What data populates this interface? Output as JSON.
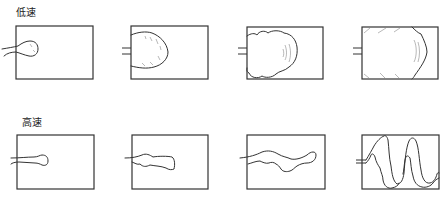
{
  "rows": [
    {
      "label": "低速",
      "meaning": "low speed",
      "stages": [
        {
          "step": 1,
          "description": "small rounded blob entering through gate"
        },
        {
          "step": 2,
          "description": "dome-shaped front filling left half"
        },
        {
          "step": 3,
          "description": "cloud-like front filling most of cavity"
        },
        {
          "step": 4,
          "description": "cavity nearly filled, front near right wall"
        }
      ]
    },
    {
      "label": "高速",
      "meaning": "high speed",
      "stages": [
        {
          "step": 1,
          "description": "narrow jet with bulb tip"
        },
        {
          "step": 2,
          "description": "jetting stream extending into cavity"
        },
        {
          "step": 3,
          "description": "long wavy jet reaching right wall"
        },
        {
          "step": 4,
          "description": "jet folding in serpentine pattern"
        }
      ]
    }
  ],
  "colors": {
    "line": "#333333",
    "hatch": "#888888",
    "background": "#ffffff"
  }
}
